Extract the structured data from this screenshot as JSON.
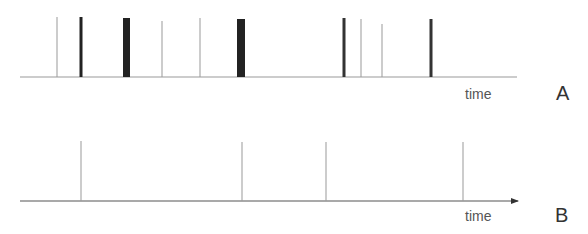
{
  "panels": {
    "A": {
      "label": "A",
      "axis_label": "time",
      "axis": {
        "x1": 20,
        "x2": 517,
        "y": 77,
        "color": "#9a9a9a",
        "arrow": false
      },
      "spikes": [
        {
          "x": 57,
          "top": 17,
          "width": 1,
          "color": "#9a9a9a"
        },
        {
          "x": 81,
          "top": 17,
          "width": 3,
          "color": "#222222"
        },
        {
          "x": 126.5,
          "top": 18,
          "width": 7,
          "color": "#222222"
        },
        {
          "x": 162,
          "top": 21,
          "width": 1,
          "color": "#9a9a9a"
        },
        {
          "x": 200,
          "top": 18,
          "width": 1,
          "color": "#9a9a9a"
        },
        {
          "x": 241,
          "top": 19,
          "width": 8,
          "color": "#222222"
        },
        {
          "x": 344,
          "top": 18,
          "width": 3,
          "color": "#333333"
        },
        {
          "x": 361,
          "top": 19,
          "width": 1,
          "color": "#9a9a9a"
        },
        {
          "x": 382,
          "top": 24,
          "width": 1,
          "color": "#9a9a9a"
        },
        {
          "x": 431,
          "top": 19,
          "width": 3,
          "color": "#333333"
        }
      ]
    },
    "B": {
      "label": "B",
      "axis_label": "time",
      "axis": {
        "x1": 20,
        "x2": 518,
        "y": 201,
        "color": "#555555",
        "arrow": true
      },
      "spikes": [
        {
          "x": 81,
          "top": 141,
          "width": 1,
          "color": "#9a9a9a"
        },
        {
          "x": 242,
          "top": 142,
          "width": 1,
          "color": "#9a9a9a"
        },
        {
          "x": 326,
          "top": 142,
          "width": 1,
          "color": "#9a9a9a"
        },
        {
          "x": 463,
          "top": 142,
          "width": 1,
          "color": "#9a9a9a"
        }
      ]
    }
  }
}
